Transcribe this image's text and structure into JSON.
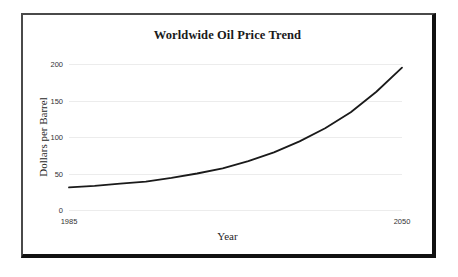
{
  "chart_data": {
    "type": "line",
    "title": "Worldwide Oil Price Trend",
    "xlabel": "Year",
    "ylabel": "Dollars per Barrel",
    "xlim": [
      1985,
      2050
    ],
    "ylim": [
      0,
      200
    ],
    "grid": true,
    "legend": "none",
    "x_tick_labels": [
      "1985",
      "2050"
    ],
    "y_tick_labels": [
      "0",
      "50",
      "100",
      "150",
      "200"
    ],
    "y_ticks": [
      0,
      50,
      100,
      150,
      200
    ],
    "series": [
      {
        "name": "Oil price",
        "color": "#1a1a1a",
        "x": [
          1985,
          1990,
          1995,
          2000,
          2005,
          2010,
          2015,
          2020,
          2025,
          2030,
          2035,
          2040,
          2045,
          2050
        ],
        "values": [
          31,
          33,
          36,
          39,
          44,
          50,
          57,
          67,
          79,
          94,
          112,
          134,
          162,
          195
        ]
      }
    ]
  },
  "chart": {
    "title": "Worldwide Oil Price Trend",
    "x_axis_label": "Year",
    "y_axis_label": "Dollars per Barrel",
    "x_ticks": [
      {
        "label": "1985"
      },
      {
        "label": "2050"
      }
    ],
    "y_ticks": [
      {
        "label": "200",
        "value": 200
      },
      {
        "label": "150",
        "value": 150
      },
      {
        "label": "100",
        "value": 100
      },
      {
        "label": "50",
        "value": 50
      },
      {
        "label": "0",
        "value": 0
      }
    ],
    "colors": {
      "line": "#1a1a1a",
      "grid": "#ececec",
      "frame": "#111111",
      "background": "#ffffff"
    }
  }
}
